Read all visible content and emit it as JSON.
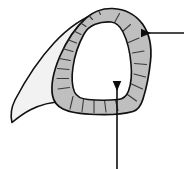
{
  "figure": {
    "canvas": {
      "width": 184,
      "height": 169,
      "background": "#ffffff"
    },
    "colors": {
      "background": "#ffffff",
      "wall_fill": "#bfbfbf",
      "wing_fill": "#f2f2f2",
      "cavity_fill": "#ffffff",
      "outline": "#111111",
      "hatch": "#3a3a3a",
      "arrow": "#0d0d0d"
    },
    "parts": [
      {
        "id": "outer-wall",
        "label": "outer wall band",
        "fill": "#bfbfbf",
        "stroke": "#111111",
        "stroke_width": 1.6,
        "description": "Thick gray triangular ring forming the wall of the structure"
      },
      {
        "id": "wing-flange",
        "label": "lateral flange",
        "fill": "#f2f2f2",
        "stroke": "#111111",
        "stroke_width": 1.6,
        "description": "Pale curved wing extending to a point at lower left"
      },
      {
        "id": "inner-cavity",
        "label": "inner cavity",
        "fill": "#ffffff",
        "stroke": "#111111",
        "stroke_width": 1.6,
        "description": "White rounded triangular lumen at the centre"
      }
    ],
    "hatch_marks": {
      "label": "radial striations",
      "stroke": "#3a3a3a",
      "stroke_width": 1.1,
      "count": 22,
      "description": "Short radial lines crossing the gray wall band"
    },
    "annotations": [
      {
        "id": "annotation-right",
        "label": "right leader arrow",
        "direction": "left",
        "points_to": "outer-wall",
        "text": "",
        "line": {
          "x1": 184,
          "y1": 33,
          "x2": 139,
          "y2": 33
        }
      },
      {
        "id": "annotation-bottom",
        "label": "bottom leader arrow",
        "direction": "up",
        "points_to": "inner-cavity",
        "text": "",
        "line": {
          "x1": 117,
          "y1": 169,
          "x2": 117,
          "y2": 79
        }
      }
    ]
  }
}
